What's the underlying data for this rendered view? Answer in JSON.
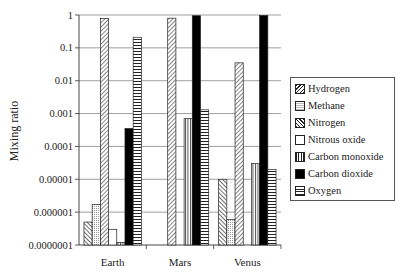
{
  "chart_data": {
    "type": "bar",
    "title": "",
    "xlabel": "",
    "ylabel": "Mixing ratio",
    "yscale": "log",
    "ylim": [
      1e-07,
      1
    ],
    "yticks": [
      "1",
      "0.1",
      "0.01",
      "0.001",
      "0.0001",
      "0.00001",
      "0.000001",
      "0.0000001"
    ],
    "grid": true,
    "legend_position": "right",
    "categories": [
      "Earth",
      "Mars",
      "Venus"
    ],
    "series": [
      {
        "name": "Hydrogen",
        "pattern": "diag-back",
        "values": [
          5e-07,
          null,
          1e-05
        ]
      },
      {
        "name": "Methane",
        "pattern": "dots",
        "values": [
          1.7e-06,
          null,
          6e-07
        ]
      },
      {
        "name": "Nitrogen",
        "pattern": "diag-fwd",
        "values": [
          0.78,
          0.8,
          0.035
        ]
      },
      {
        "name": "Nitrous oxide",
        "pattern": "empty",
        "values": [
          3e-07,
          null,
          null
        ]
      },
      {
        "name": "Carbon monoxide",
        "pattern": "vertical",
        "values": [
          1.2e-07,
          0.0007,
          3e-05
        ]
      },
      {
        "name": "Carbon dioxide",
        "pattern": "solid",
        "values": [
          0.00035,
          0.95,
          0.965
        ]
      },
      {
        "name": "Oxygen",
        "pattern": "horizontal",
        "values": [
          0.21,
          0.0013,
          2e-05
        ]
      }
    ]
  },
  "legend": {
    "items": [
      "Hydrogen",
      "Methane",
      "Nitrogen",
      "Nitrous oxide",
      "Carbon monoxide",
      "Carbon dioxide",
      "Oxygen"
    ]
  }
}
